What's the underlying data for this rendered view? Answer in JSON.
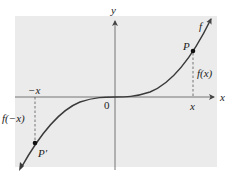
{
  "figure": {
    "background_color": "#ebebeb",
    "curve_color": "#3a3a3a",
    "axis_color": "#555555",
    "labels": {
      "y_axis": "y",
      "x_axis": "x",
      "origin": "0",
      "curve": "f",
      "point_p": "P",
      "point_p_prime": "P′",
      "fx": "f(x)",
      "f_neg_x": "f(−x)",
      "tick_x": "x",
      "tick_neg_x": "−x"
    },
    "points": [
      {
        "name": "P",
        "px": 193,
        "py": 51
      },
      {
        "name": "P′",
        "px": 35,
        "py": 143
      }
    ]
  }
}
